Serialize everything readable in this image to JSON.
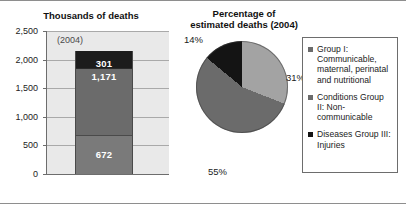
{
  "chart_data": [
    {
      "type": "bar",
      "title": "Thousands of deaths",
      "annotation": "(2004)",
      "xlabel": "",
      "ylabel": "",
      "ylim": [
        0,
        2500
      ],
      "ytick_labels": [
        "2,500",
        "2,000",
        "1,500",
        "1,000",
        "500",
        "0"
      ],
      "ytick_values": [
        2500,
        2000,
        1500,
        1000,
        500,
        0
      ],
      "grid": true,
      "stacked": true,
      "categories": [
        "2004"
      ],
      "series": [
        {
          "name": "Group I: Communicable, maternal, perinatal and nutritional",
          "values": [
            672
          ],
          "label": "672",
          "color": "#7a7a7a"
        },
        {
          "name": "Conditions Group II: Non-communicable",
          "values": [
            1171
          ],
          "label": "1,171",
          "color": "#6b6b6b"
        },
        {
          "name": "Diseases Group III: Injuries",
          "values": [
            301
          ],
          "label": "301",
          "color": "#1c1c1c"
        }
      ],
      "total": 2144
    },
    {
      "type": "pie",
      "title": "Percentage of estimated deaths (2004)",
      "labels": [
        "31%",
        "55%",
        "14%"
      ],
      "values": [
        31,
        55,
        14
      ],
      "slices": [
        {
          "name": "Group I: Communicable, maternal, perinatal and nutritional",
          "value": 31,
          "label": "31%",
          "color": "#a3a3a3"
        },
        {
          "name": "Conditions Group II: Non-communicable",
          "value": 55,
          "label": "55%",
          "color": "#6b6b6b"
        },
        {
          "name": "Diseases Group III: Injuries",
          "value": 14,
          "label": "14%",
          "color": "#141414"
        }
      ],
      "legend_position": "right"
    }
  ],
  "bar_chart": {
    "title": "Thousands of deaths",
    "year_annotation": "(2004)",
    "y_ticks": [
      {
        "label": "2,500",
        "value": 2500
      },
      {
        "label": "2,000",
        "value": 2000
      },
      {
        "label": "1,500",
        "value": 1500
      },
      {
        "label": "1,000",
        "value": 1000
      },
      {
        "label": "500",
        "value": 500
      },
      {
        "label": "0",
        "value": 0
      }
    ],
    "segments": [
      {
        "label": "301",
        "value": 301,
        "color": "#1c1c1c"
      },
      {
        "label": "1,171",
        "value": 1171,
        "color": "#6b6b6b"
      },
      {
        "label": "672",
        "value": 672,
        "color": "#7a7a7a"
      }
    ]
  },
  "pie_chart": {
    "title_line1": "Percentage of",
    "title_line2": "estimated deaths (2004)",
    "labels": {
      "slice_31": "31%",
      "slice_55": "55%",
      "slice_14": "14%"
    }
  },
  "legend": {
    "items": [
      {
        "marker_color": "#6b6b6b",
        "text": "Group I: Communicable, maternal, perinatal and nutritional"
      },
      {
        "marker_color": "#6b6b6b",
        "text": "Conditions Group II: Non-communicable"
      },
      {
        "marker_color": "#141414",
        "text": "Diseases Group III: Injuries"
      }
    ]
  }
}
